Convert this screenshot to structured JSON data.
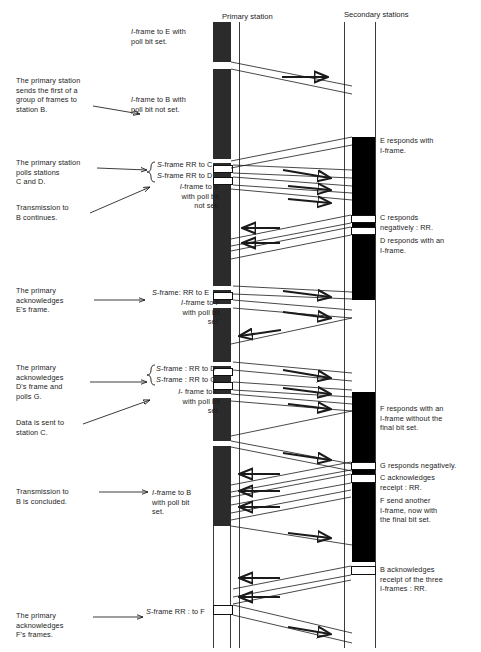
{
  "diagram": {
    "type": "hdlc-normal-response-mode-timing-diagram",
    "headers": {
      "primary": "Primary station",
      "secondary": "Secondary stations"
    },
    "left_notes": [
      {
        "id": "note-1",
        "text": "The primary station\nsends the first of a\ngroup of frames to\nstation B."
      },
      {
        "id": "note-2",
        "text": "The primary station\npolls stations\nC and D."
      },
      {
        "id": "note-3",
        "text": "Transmission to\nB continues."
      },
      {
        "id": "note-4",
        "text": "The primary\nacknowledges\nE's frame."
      },
      {
        "id": "note-5",
        "text": "The primary\nacknowledges\nD's frame and\npolls G."
      },
      {
        "id": "note-6",
        "text": "Data is sent to\nstation C."
      },
      {
        "id": "note-7",
        "text": "Transmission to\nB is concluded."
      },
      {
        "id": "note-8",
        "text": "The primary\nacknowledges\nF's frames."
      }
    ],
    "frame_labels": [
      {
        "id": "frame-label-1",
        "text": "I-frame to E with\npoll bit set.",
        "italic_prefix": "I"
      },
      {
        "id": "frame-label-2",
        "text": "I-frame to B with\npoll bit not set.",
        "italic_prefix": "I"
      },
      {
        "id": "frame-label-3",
        "text": "S-frame RR to C",
        "italic_prefix": "S"
      },
      {
        "id": "frame-label-4",
        "text": "S-frame RR to D",
        "italic_prefix": "S"
      },
      {
        "id": "frame-label-5",
        "text": "I-frame to B\nwith poll bit\nnot set.",
        "italic_prefix": "I"
      },
      {
        "id": "frame-label-6",
        "text": "S-frame: RR to E",
        "italic_prefix": "S"
      },
      {
        "id": "frame-label-7",
        "text": "I-frame to F\nwith poll bit\nset.",
        "italic_prefix": "I"
      },
      {
        "id": "frame-label-8",
        "text": "S-frame : RR to D",
        "italic_prefix": "S"
      },
      {
        "id": "frame-label-9",
        "text": "S-frame : RR to G",
        "italic_prefix": "S"
      },
      {
        "id": "frame-label-10",
        "text": "I- frame to C\nwith poll bit\nset.",
        "italic_prefix": "I"
      },
      {
        "id": "frame-label-11",
        "text": "I-frame to B\nwith poll bit\nset.",
        "italic_prefix": "I"
      },
      {
        "id": "frame-label-12",
        "text": "S-frame RR : to F",
        "italic_prefix": "S"
      }
    ],
    "right_notes": [
      {
        "id": "right-note-1",
        "text": "E responds with\nI-frame."
      },
      {
        "id": "right-note-2",
        "text": "C responds\nnegatively : RR."
      },
      {
        "id": "right-note-3",
        "text": "D responds with an\nI-frame."
      },
      {
        "id": "right-note-4",
        "text": "F responds with an\nI-frame without the\nfinal bit set."
      },
      {
        "id": "right-note-5",
        "text": "G responds negatively."
      },
      {
        "id": "right-note-6",
        "text": "C acknowledges\nreceipt : RR."
      },
      {
        "id": "right-note-7",
        "text": "F send another\nI-frame, now with\nthe final bit set."
      },
      {
        "id": "right-note-8",
        "text": "B acknowledges\nreceipt of the three\nI-frames : RR."
      }
    ],
    "colors": {
      "bar_primary": "#2b2b2b",
      "bar_secondary": "#000000",
      "background": "#ffffff",
      "line": "#1a1a1a"
    },
    "geometry": {
      "primary_bar_x": 213,
      "primary_bar_width": 18,
      "primary_edge_x": 239,
      "secondary_bar_x": 352,
      "secondary_bar_width": 23,
      "secondary_edge_x": 344,
      "top_y": 22,
      "bottom_y": 648
    }
  }
}
